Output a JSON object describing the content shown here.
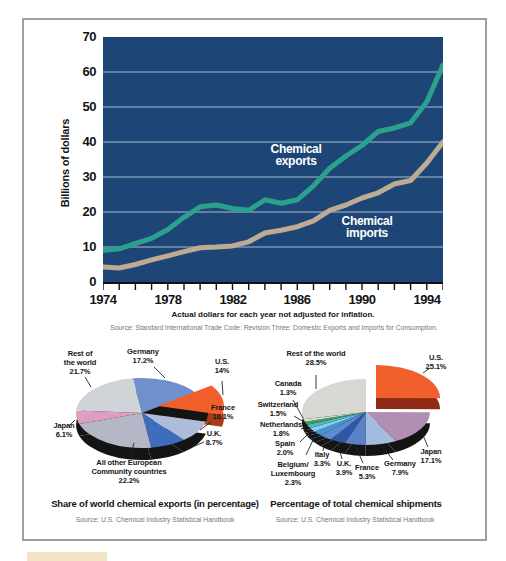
{
  "chart_data": [
    {
      "type": "line",
      "ylabel": "Billions of dollars",
      "caption": "Actual dollars for each year not adjusted for inflation.",
      "source": "Source: Standard International Trade Code: Revision Three: Domestic Exports and Imports for Consumption.",
      "x_start": 1974,
      "x_end": 1995,
      "xtick_labels": [
        1974,
        1978,
        1982,
        1986,
        1990,
        1994
      ],
      "ytick_values": [
        0,
        10,
        20,
        30,
        40,
        50,
        60,
        70
      ],
      "ylim": [
        0,
        70
      ],
      "grid": "horizontal",
      "plot_bg": "#1d4576",
      "grid_color": "#a9bdd3",
      "axis_color": "#101010",
      "series": [
        {
          "name": "Chemical exports",
          "color": "#2ba08d",
          "label_lines": [
            "Chemical",
            "exports"
          ],
          "label_pos": [
            193,
            116
          ],
          "values": [
            9,
            9.5,
            11,
            12.5,
            15,
            18.5,
            21.5,
            22,
            21,
            20.5,
            23.5,
            22.5,
            23.5,
            27.5,
            32.5,
            36,
            39,
            43,
            44,
            45.5,
            51.5,
            62
          ]
        },
        {
          "name": "Chemical imports",
          "color": "#bdac93",
          "label_lines": [
            "Chemical",
            "imports"
          ],
          "label_pos": [
            264,
            188
          ],
          "values": [
            4.3,
            4,
            5,
            6.3,
            7.5,
            8.7,
            9.8,
            10,
            10.3,
            11.5,
            14,
            14.8,
            15.8,
            17.5,
            20.5,
            22,
            24,
            25.5,
            28,
            29,
            34,
            40
          ]
        }
      ]
    },
    {
      "type": "pie",
      "title": "Share of world chemical exports (in percentage)",
      "source": "Source: U.S. Chemical Industry Statistical Handbook",
      "style": "3d-exploded",
      "start_angle_deg": -98,
      "direction": "clockwise",
      "geom": {
        "cx": 112,
        "cy": 70,
        "rx": 66,
        "ry": 35,
        "depth": 12
      },
      "slices": [
        {
          "id": "germany",
          "label": "Germany",
          "pct": 17.2,
          "display": "17.2%",
          "color": "#7090cc",
          "label_lines": [
            "Germany",
            "17.2%"
          ],
          "label_pos": [
            113,
            14
          ],
          "line": [
            135,
            35,
            124,
            24
          ]
        },
        {
          "id": "us",
          "label": "U.S.",
          "pct": 14,
          "display": "14%",
          "color": "#f15f2c",
          "side_color": "#a63b1c",
          "gap_fill": "#141414",
          "exploded": true,
          "explode_offset": [
            16,
            -7
          ],
          "label_lines": [
            "U.S.",
            "14%"
          ],
          "label_pos": [
            192,
            24
          ],
          "line": [
            193,
            52,
            192,
            38
          ]
        },
        {
          "id": "france",
          "label": "France",
          "pct": 10.1,
          "display": "10.1%",
          "color": "#adbcd8",
          "label_lines": [
            "France",
            "10.1%"
          ],
          "label_pos": [
            193,
            70
          ],
          "line": [
            170,
            87,
            181,
            79
          ]
        },
        {
          "id": "uk",
          "label": "U.K.",
          "pct": 8.7,
          "display": "8.7%",
          "color": "#3e6dbb",
          "label_lines": [
            "U.K.",
            "8.7%"
          ],
          "label_pos": [
            184,
            96
          ],
          "line": [
            158,
            106,
            174,
            99
          ]
        },
        {
          "id": "ec",
          "label": "All other European Community countries",
          "pct": 22.2,
          "display": "22.2%",
          "color": "#b4b7c5",
          "label_lines": [
            "All other European",
            "Community countries",
            "22.2%"
          ],
          "label_pos": [
            99,
            129
          ],
          "line": [
            104,
            100,
            100,
            115
          ]
        },
        {
          "id": "japan",
          "label": "Japan",
          "pct": 6.1,
          "display": "6.1%",
          "color": "#dd9ec2",
          "label_lines": [
            "Japan",
            "6.1%"
          ],
          "label_pos": [
            34,
            88
          ],
          "line": [
            45,
            77,
            39,
            83
          ]
        },
        {
          "id": "rest",
          "label": "Rest of the world",
          "pct": 21.7,
          "display": "21.7%",
          "color": "#d0d4d9",
          "label_lines": [
            "Rest of",
            "the world",
            "21.7%"
          ],
          "label_pos": [
            50,
            20
          ],
          "line": [
            61,
            44,
            55,
            34
          ]
        }
      ]
    },
    {
      "type": "pie",
      "title": "Percentage of total chemical shipments",
      "source": "Source: U.S. Chemical Industry Statistical Handbook",
      "style": "3d-exploded",
      "start_angle_deg": -90,
      "direction": "clockwise",
      "geom": {
        "cx": 106,
        "cy": 69,
        "rx": 64,
        "ry": 33,
        "depth": 11
      },
      "slices": [
        {
          "id": "us",
          "label": "U.S.",
          "pct": 25.1,
          "display": "25.1%",
          "color": "#f15f2c",
          "side_color": "#8f2a16",
          "exploded": true,
          "explode_offset": [
            10,
            -14
          ],
          "label_lines": [
            "U.S.",
            "25.1%"
          ],
          "label_pos": [
            176,
            20
          ],
          "line": [
            163,
            30,
            170,
            25
          ]
        },
        {
          "id": "japan",
          "label": "Japan",
          "pct": 17.1,
          "display": "17.1%",
          "color": "#b08fb2",
          "label_lines": [
            "Japan",
            "17.1%"
          ],
          "label_pos": [
            171,
            114
          ],
          "line": [
            162,
            90,
            168,
            104
          ]
        },
        {
          "id": "germany",
          "label": "Germany",
          "pct": 7.9,
          "display": "7.9%",
          "color": "#a3bce0",
          "label_lines": [
            "Germany",
            "7.9%"
          ],
          "label_pos": [
            140,
            126
          ],
          "line": [
            123,
            104,
            133,
            117
          ]
        },
        {
          "id": "france",
          "label": "France",
          "pct": 5.3,
          "display": "5.3%",
          "color": "#5b82c6",
          "label_lines": [
            "France",
            "5.3%"
          ],
          "label_pos": [
            107,
            130
          ],
          "line": [
            96,
            104,
            103,
            120
          ]
        },
        {
          "id": "uk",
          "label": "U.K.",
          "pct": 3.9,
          "display": "3.9%",
          "color": "#2f57a5",
          "label_lines": [
            "U.K.",
            "3.9%"
          ],
          "label_pos": [
            84,
            126
          ],
          "line": [
            78,
            101,
            82,
            116
          ]
        },
        {
          "id": "italy",
          "label": "Italy",
          "pct": 3.3,
          "display": "3.3%",
          "color": "#5c8ccd",
          "label_lines": [
            "Italy",
            "3.3%"
          ],
          "label_pos": [
            62,
            117
          ],
          "line": [
            65,
            97,
            63,
            108
          ]
        },
        {
          "id": "belgium-luxembourg",
          "label": "Belgium/Luxembourg",
          "pct": 2.3,
          "display": "2.3%",
          "color": "#3f97d2",
          "label_lines": [
            "Belgium/",
            "Luxembourg",
            "2.3%"
          ],
          "label_pos": [
            33,
            131
          ],
          "line": [
            55,
            93,
            46,
            112
          ]
        },
        {
          "id": "spain",
          "label": "Spain",
          "pct": 2.0,
          "display": "2.0%",
          "color": "#8ecbe8",
          "label_lines": [
            "Spain",
            "2.0%"
          ],
          "label_pos": [
            25,
            106
          ],
          "line": [
            50,
            89,
            40,
            99
          ]
        },
        {
          "id": "netherlands",
          "label": "Netherlands",
          "pct": 1.8,
          "display": "1.8%",
          "color": "#4fb3d6",
          "label_lines": [
            "Netherlands",
            "1.8%"
          ],
          "label_pos": [
            21,
            87
          ],
          "line": [
            46,
            84,
            41,
            86
          ]
        },
        {
          "id": "switzerland",
          "label": "Switzerland",
          "pct": 1.5,
          "display": "1.5%",
          "color": "#419d57",
          "label_lines": [
            "Switzerland",
            "1.5%"
          ],
          "label_pos": [
            18,
            67
          ],
          "line": [
            44,
            79,
            34,
            73
          ]
        },
        {
          "id": "canada",
          "label": "Canada",
          "pct": 1.3,
          "display": "1.3%",
          "color": "#cfe3cd",
          "label_lines": [
            "Canada",
            "1.3%"
          ],
          "label_pos": [
            28,
            46
          ],
          "line": [
            43,
            75,
            33,
            57
          ]
        },
        {
          "id": "rest",
          "label": "Rest of the world",
          "pct": 28.5,
          "display": "28.5%",
          "color": "#d6d8d4",
          "label_lines": [
            "Rest of the world",
            "28.5%"
          ],
          "label_pos": [
            56,
            16
          ],
          "line": [
            56,
            46,
            56,
            32
          ]
        }
      ]
    }
  ]
}
